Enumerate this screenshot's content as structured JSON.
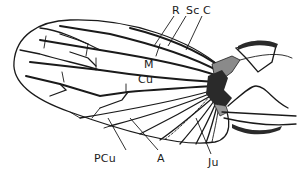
{
  "figure": {
    "labels": {
      "R": "R",
      "Sc": "Sc",
      "C": "C",
      "M": "M",
      "Cu": "Cu",
      "PCu": "PCu",
      "A": "A",
      "Ju": "Ju"
    },
    "colors": {
      "line": "#1a1a1a",
      "shade_dark": "#2a2a2a",
      "shade_mid": "#8a8a8a",
      "background": "#ffffff"
    }
  }
}
